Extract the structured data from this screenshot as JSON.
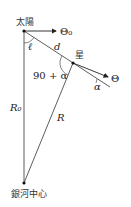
{
  "diagram": {
    "labels": {
      "sun": "太陽",
      "star": "星",
      "galactic_center": "銀河中心",
      "theta0": "Θ₀",
      "theta": "Θ",
      "ell": "ℓ",
      "d": "d",
      "angle_star": "90 + α",
      "alpha": "α",
      "R0": "R₀",
      "R": "R"
    },
    "points": {
      "sun": [
        24,
        31
      ],
      "star": [
        73,
        63
      ],
      "galactic_center": [
        24,
        183
      ]
    },
    "colors": {
      "line": "#333333",
      "text": "#222222"
    }
  }
}
